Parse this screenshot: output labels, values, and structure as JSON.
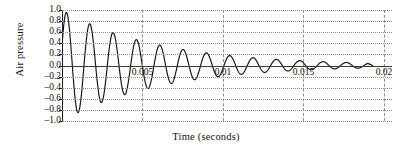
{
  "chart_data": {
    "type": "line",
    "title": "",
    "xlabel": "Time (seconds)",
    "ylabel": "Air pressure",
    "xlim": [
      0,
      0.0205
    ],
    "ylim": [
      -1.0,
      1.0
    ],
    "grid": true,
    "legend": false,
    "xticks": [
      0.005,
      0.01,
      0.015,
      0.02
    ],
    "xtick_labels": [
      "0.005",
      "0.01",
      "0.015",
      "0.02"
    ],
    "yticks": [
      1.0,
      0.8,
      0.6,
      0.4,
      0.2,
      0.0,
      -0.2,
      -0.4,
      -0.6,
      -0.8,
      -1.0
    ],
    "ytick_labels": [
      "1.0",
      "0.8",
      "0.6",
      "0.4",
      "0.2",
      "0.0",
      "–0.2",
      "–0.4",
      "–0.6",
      "–0.8",
      "–1.0"
    ],
    "model": {
      "amplitude": 1.0,
      "decay_constant": 165,
      "frequency_hz": 690,
      "phase_offset": 0.36,
      "t_start": 0,
      "t_end": 0.019
    },
    "series": [
      {
        "name": "Air pressure",
        "color": "#111111",
        "peaks_t": [
          0.00047,
          0.00192,
          0.00337,
          0.00482,
          0.00627,
          0.00772,
          0.00917,
          0.01062,
          0.01207,
          0.01352,
          0.01497,
          0.01642,
          0.01787
        ],
        "peaks_y": [
          1.0,
          0.91,
          0.8,
          0.71,
          0.62,
          0.54,
          0.46,
          0.39,
          0.33,
          0.27,
          0.21,
          0.15,
          0.1
        ],
        "troughs_t": [
          0.00119,
          0.00264,
          0.00409,
          0.00554,
          0.00699,
          0.00844,
          0.00989,
          0.01134,
          0.01279,
          0.01424,
          0.01569,
          0.01714
        ],
        "troughs_y": [
          -0.95,
          -0.85,
          -0.75,
          -0.66,
          -0.58,
          -0.5,
          -0.43,
          -0.36,
          -0.3,
          -0.24,
          -0.18,
          -0.12
        ],
        "y_at_t0": 0.35
      }
    ]
  }
}
